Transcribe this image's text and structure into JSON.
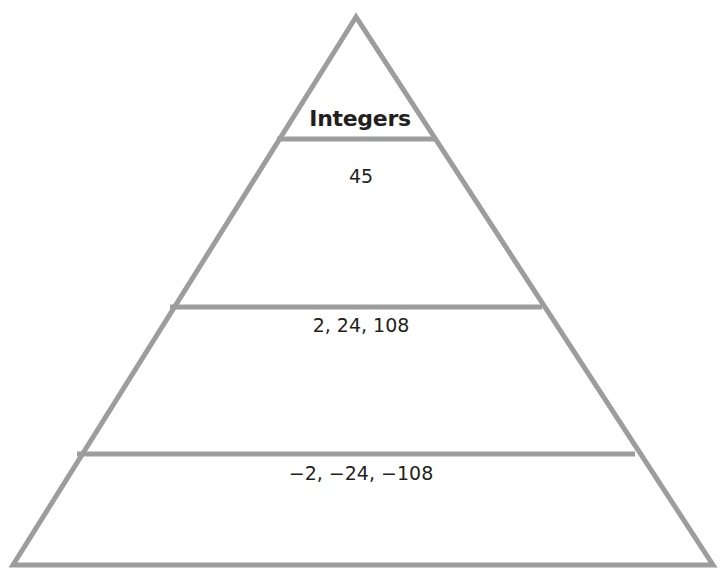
{
  "diagram": {
    "type": "pyramid",
    "title": "Integers",
    "stroke_color": "#9d9d9d",
    "text_color": "#231f20",
    "background": "#ffffff",
    "tiers": [
      {
        "level": "top",
        "label": "Integers"
      },
      {
        "level": "upper",
        "values": "45"
      },
      {
        "level": "middle",
        "values": "2, 24, 108"
      },
      {
        "level": "bottom",
        "values": "−2, −24, −108"
      }
    ]
  }
}
